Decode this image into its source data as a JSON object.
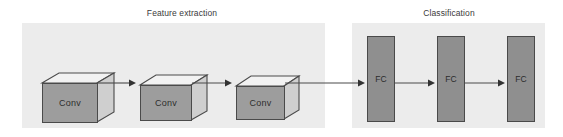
{
  "diagram": {
    "background_color": "#ffffff",
    "panel_color": "#ececec",
    "cube_front_color": "#9d9d9d",
    "cube_top_color": "#f2f2f2",
    "cube_side_color": "#cfcfcf",
    "fc_color": "#8f8f8f",
    "stroke_color": "#4a4a4a",
    "text_color": "#2e2e2e"
  },
  "sections": [
    {
      "id": "feature-extraction",
      "label": "Feature extraction"
    },
    {
      "id": "classification",
      "label": "Classification"
    }
  ],
  "conv_blocks": [
    {
      "label": "Conv"
    },
    {
      "label": "Conv"
    },
    {
      "label": "Conv"
    }
  ],
  "fc_blocks": [
    {
      "label": "FC"
    },
    {
      "label": "FC"
    },
    {
      "label": "FC"
    }
  ],
  "arrows": [
    {
      "from": "Conv 1",
      "to": "Conv 2"
    },
    {
      "from": "Conv 2",
      "to": "Conv 3"
    },
    {
      "from": "Conv 3",
      "to": "FC 1"
    },
    {
      "from": "FC 1",
      "to": "FC 2"
    },
    {
      "from": "FC 2",
      "to": "FC 3"
    }
  ]
}
